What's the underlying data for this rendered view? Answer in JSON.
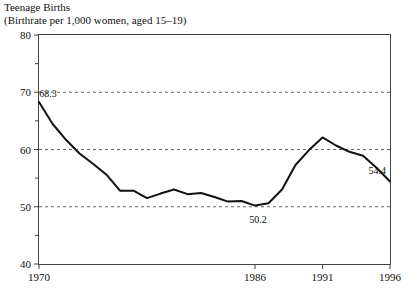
{
  "chart_data": {
    "type": "line",
    "title": "Teenage Births",
    "subtitle": "(Birthrate per 1,000 women, aged 15–19)",
    "xlabel": "",
    "ylabel": "",
    "ylim": [
      40,
      80
    ],
    "xlim": [
      1970,
      1996
    ],
    "grid": true,
    "gridlines_y": [
      50,
      60,
      70
    ],
    "legend": "none",
    "y_ticks_major": [
      40,
      50,
      60,
      70,
      80
    ],
    "y_ticks_minor": [
      45,
      55,
      65,
      75
    ],
    "y_tick_labels": [
      "40",
      "50",
      "60",
      "70",
      "80"
    ],
    "x_ticks": [
      1970,
      1986,
      1991,
      1996
    ],
    "x_tick_labels": [
      "1970",
      "1986",
      "1991",
      "1996"
    ],
    "x": [
      1970,
      1971,
      1972,
      1973,
      1974,
      1975,
      1976,
      1977,
      1978,
      1979,
      1980,
      1981,
      1982,
      1983,
      1984,
      1985,
      1986,
      1987,
      1988,
      1989,
      1990,
      1991,
      1992,
      1993,
      1994,
      1995,
      1996
    ],
    "values": [
      68.3,
      64.5,
      61.7,
      59.3,
      57.5,
      55.6,
      52.8,
      52.8,
      51.5,
      52.3,
      53.0,
      52.2,
      52.4,
      51.7,
      50.9,
      51.0,
      50.2,
      50.6,
      53.0,
      57.3,
      59.9,
      62.1,
      60.7,
      59.6,
      58.9,
      56.8,
      54.4
    ],
    "annotations": [
      {
        "label": "68.3",
        "x": 1970,
        "y": 68.3
      },
      {
        "label": "50.2",
        "x": 1986,
        "y": 50.2
      },
      {
        "label": "54.4",
        "x": 1996,
        "y": 54.4
      }
    ],
    "series_color": "#111111",
    "grid_color": "#666666",
    "axis_color": "#444444"
  }
}
